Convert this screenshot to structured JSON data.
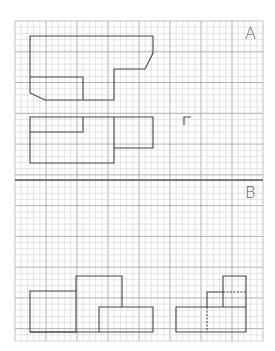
{
  "grid": {
    "left": 15,
    "top": 21,
    "right": 263,
    "bottom": 341,
    "cols": 40,
    "rows": 52,
    "major_every": 5,
    "minor_color": "#d4d4d4",
    "major_color": "#a8a8a8",
    "frame_color": "#b8b8b8",
    "divider_y": 180,
    "divider_color": "#555555"
  },
  "stroke_color": "#444444",
  "sections": [
    {
      "label": "A",
      "label_pos": {
        "x": 245,
        "y": 26
      },
      "paths": [
        {
          "name": "shape-a-outline",
          "d": "M30 36 H153 V53 L145 69 H114 V100 H45 L30 93 Z"
        },
        {
          "name": "shape-a-inner-rect",
          "d": "M30 77 H83 V100"
        },
        {
          "name": "shape-a-lower-outline",
          "d": "M30 117 H153 V148 H114 V163 H30 Z"
        },
        {
          "name": "shape-a-lower-inner",
          "d": "M30 132 H83 V117"
        },
        {
          "name": "shape-a-lower-divider",
          "d": "M114 117 V148"
        },
        {
          "name": "shape-a-small-mark",
          "d": "M184 125 V117 H191"
        }
      ]
    },
    {
      "label": "B",
      "label_pos": {
        "x": 245,
        "y": 185
      },
      "paths": [
        {
          "name": "shape-b-left-rect",
          "d": "M30 332 V291 H76 V332 Z"
        },
        {
          "name": "shape-b-tall-rect",
          "d": "M76 291 V276 H122 V307"
        },
        {
          "name": "shape-b-right-rect",
          "d": "M99 332 V307 H153 V332 H30"
        },
        {
          "name": "shape-b-step-base",
          "d": "M176 307 H246 V332 H176 Z"
        },
        {
          "name": "shape-b-step-mid",
          "d": "M207 307 V292 H223"
        },
        {
          "name": "shape-b-step-top",
          "d": "M223 307 V276 H246 V307"
        }
      ],
      "dashed_paths": [
        {
          "name": "shape-b-dashed-vertical",
          "d": "M207 307 V332"
        },
        {
          "name": "shape-b-dashed-horizontal",
          "d": "M223 292 H246"
        }
      ]
    }
  ]
}
